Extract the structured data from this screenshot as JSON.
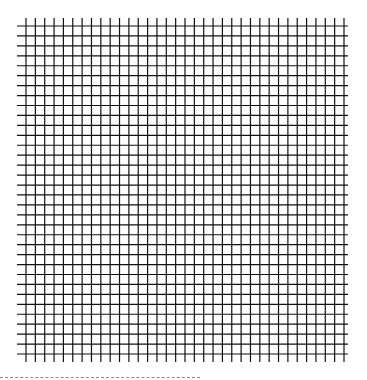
{
  "figure": {
    "grid": {
      "vertical_lines": 35,
      "horizontal_lines": 34,
      "x_start": 26,
      "x_end": 344,
      "y_start": 26,
      "y_end": 354,
      "line_overhang": 8,
      "line_color": "#111111",
      "background": "#ffffff"
    },
    "separator": {
      "style": "dashed",
      "color": "#888888",
      "x_start": 0,
      "x_end": 200,
      "y": 377
    }
  }
}
